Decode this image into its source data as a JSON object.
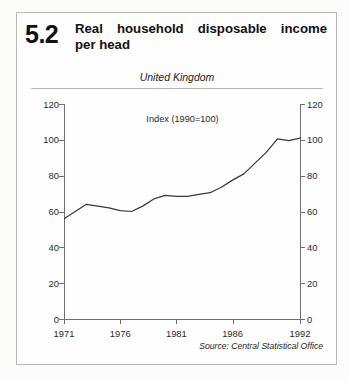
{
  "figure": {
    "number": "5.2",
    "title_line1": "Real household disposable income",
    "title_line2": "per head",
    "region": "United Kingdom",
    "source": "Source: Central Statistical Office"
  },
  "chart_data": {
    "type": "line",
    "title": "Real household disposable income per head",
    "subtitle": "Index (1990=100)",
    "region": "United Kingdom",
    "xlabel": "",
    "ylabel": "",
    "xlim": [
      1971,
      1992
    ],
    "ylim": [
      0,
      120
    ],
    "grid": false,
    "legend": null,
    "x_ticks": [
      1971,
      1976,
      1981,
      1986,
      1992
    ],
    "x_tick_labels": [
      "1971",
      "1976",
      "1981",
      "1986",
      "1992"
    ],
    "y_ticks": [
      0,
      20,
      40,
      60,
      80,
      100,
      120
    ],
    "y_tick_labels": [
      "0",
      "20",
      "40",
      "60",
      "80",
      "100",
      "120"
    ],
    "y_axis_both_sides": true,
    "line_color": "#3a3a3a",
    "x": [
      1971,
      1972,
      1973,
      1974,
      1975,
      1976,
      1977,
      1978,
      1979,
      1980,
      1981,
      1982,
      1983,
      1984,
      1985,
      1986,
      1987,
      1988,
      1989,
      1990,
      1991,
      1992
    ],
    "values": [
      56,
      60,
      64,
      63,
      62,
      60.5,
      60,
      63,
      67,
      69,
      68.5,
      68.5,
      69.5,
      70.5,
      73.5,
      77.5,
      81,
      87,
      93,
      100.5,
      99.5,
      101
    ],
    "series": [
      {
        "name": "Real household disposable income per head",
        "values": [
          56,
          60,
          64,
          63,
          62,
          60.5,
          60,
          63,
          67,
          69,
          68.5,
          68.5,
          69.5,
          70.5,
          73.5,
          77.5,
          81,
          87,
          93,
          100.5,
          99.5,
          101
        ]
      }
    ]
  }
}
